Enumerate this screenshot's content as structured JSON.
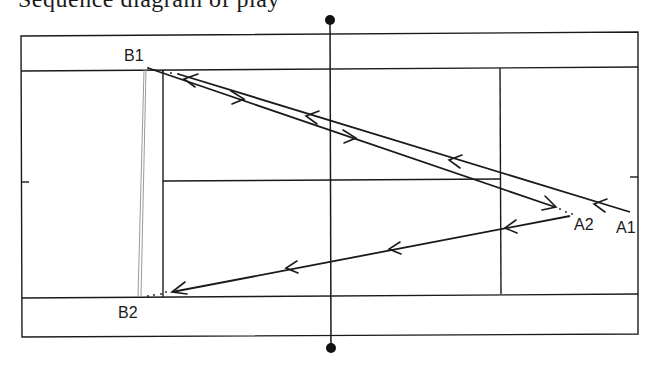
{
  "figure": {
    "caption_fragment": "Sequence diagram of play",
    "type": "tennis-court-shot-diagram",
    "orientation": "horizontal court, net vertical at center"
  },
  "labels": {
    "b1": "B1",
    "b2": "B2",
    "a1": "A1",
    "a2": "A2"
  },
  "court": {
    "outer": {
      "x1": 21,
      "y1": 35,
      "x2": 638,
      "y2": 333
    },
    "singles_top_y": 70,
    "singles_bottom_y": 296,
    "service_line_left_x": 163,
    "service_line_right_x": 500,
    "center_service_y": 181,
    "net_x": 330,
    "net_top_post_y": 20,
    "net_bottom_post_y": 348
  },
  "shots": [
    {
      "from": "A1",
      "to": "B1",
      "description": "A1 to B1 cross-court, arrows pointing left"
    },
    {
      "from": "B1",
      "to": "A2",
      "description": "B1 to A2 return, arrows pointing right"
    },
    {
      "from": "A2",
      "to": "B2",
      "description": "A2 to B2, arrows pointing left"
    }
  ],
  "colors": {
    "line": "#1a1a1a",
    "faint_line": "#9a9a9a",
    "background": "#ffffff"
  }
}
